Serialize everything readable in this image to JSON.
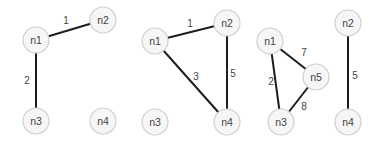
{
  "diagram": {
    "type": "weighted-undirected-graphs",
    "node_radius": 13,
    "colors": {
      "edge": "#1e1e1e",
      "node_fill": "#f6f6f6",
      "node_stroke": "#cfcfcf",
      "text": "#444444"
    },
    "graphs": [
      {
        "nodes": [
          {
            "id": "n1",
            "label": "n1",
            "x": 36,
            "y": 40
          },
          {
            "id": "n2",
            "label": "n2",
            "x": 103,
            "y": 20
          },
          {
            "id": "n3",
            "label": "n3",
            "x": 36,
            "y": 121
          },
          {
            "id": "n4",
            "label": "n4",
            "x": 103,
            "y": 121
          }
        ],
        "edges": [
          {
            "from": "n1",
            "to": "n2",
            "weight": "1",
            "lx": 66,
            "ly": 20
          },
          {
            "from": "n1",
            "to": "n3",
            "weight": "2",
            "lx": 27,
            "ly": 80
          }
        ]
      },
      {
        "nodes": [
          {
            "id": "n1",
            "label": "n1",
            "x": 155,
            "y": 41
          },
          {
            "id": "n2",
            "label": "n2",
            "x": 227,
            "y": 23
          },
          {
            "id": "n3",
            "label": "n3",
            "x": 155,
            "y": 122
          },
          {
            "id": "n4",
            "label": "n4",
            "x": 227,
            "y": 122
          }
        ],
        "edges": [
          {
            "from": "n1",
            "to": "n2",
            "weight": "1",
            "lx": 190,
            "ly": 23
          },
          {
            "from": "n1",
            "to": "n4",
            "weight": "3",
            "lx": 196,
            "ly": 76
          },
          {
            "from": "n2",
            "to": "n4",
            "weight": "5",
            "lx": 233,
            "ly": 73
          }
        ]
      },
      {
        "nodes": [
          {
            "id": "n1",
            "label": "n1",
            "x": 270,
            "y": 41
          },
          {
            "id": "n5",
            "label": "n5",
            "x": 316,
            "y": 77
          },
          {
            "id": "n3",
            "label": "n3",
            "x": 281,
            "y": 122
          }
        ],
        "edges": [
          {
            "from": "n1",
            "to": "n5",
            "weight": "7",
            "lx": 304,
            "ly": 52
          },
          {
            "from": "n1",
            "to": "n3",
            "weight": "2",
            "lx": 271,
            "ly": 81
          },
          {
            "from": "n5",
            "to": "n3",
            "weight": "8",
            "lx": 304,
            "ly": 106
          }
        ]
      },
      {
        "nodes": [
          {
            "id": "n2",
            "label": "n2",
            "x": 348,
            "y": 23
          },
          {
            "id": "n4",
            "label": "n4",
            "x": 348,
            "y": 122
          }
        ],
        "edges": [
          {
            "from": "n2",
            "to": "n4",
            "weight": "5",
            "lx": 355,
            "ly": 75
          }
        ]
      }
    ]
  }
}
